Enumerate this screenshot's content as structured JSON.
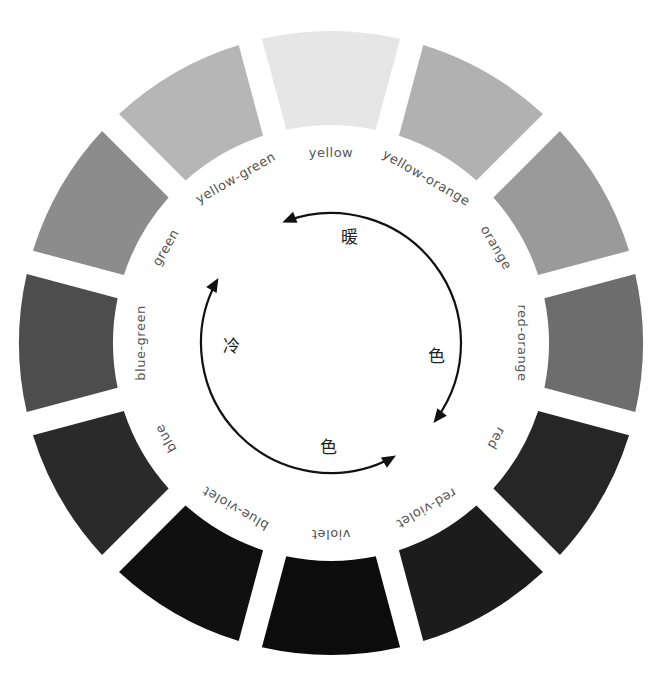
{
  "diagram": {
    "type": "color-wheel",
    "center": [
      331,
      343
    ],
    "outer_radius": 312,
    "inner_radius": 218,
    "label_radius": 190,
    "segments": [
      {
        "name": "yellow",
        "label": "yellow",
        "fill": "#e6e6e6"
      },
      {
        "name": "yellow-orange",
        "label": "yellow-orange",
        "fill": "#b1b1b1"
      },
      {
        "name": "orange",
        "label": "orange",
        "fill": "#9a9a9a"
      },
      {
        "name": "red-orange",
        "label": "red-orange",
        "fill": "#6d6d6d"
      },
      {
        "name": "red",
        "label": "red",
        "fill": "#262626"
      },
      {
        "name": "red-violet",
        "label": "red-violet",
        "fill": "#1c1c1c"
      },
      {
        "name": "violet",
        "label": "violet",
        "fill": "#0c0c0c"
      },
      {
        "name": "blue-violet",
        "label": "blue-violet",
        "fill": "#101010"
      },
      {
        "name": "blue",
        "label": "blue",
        "fill": "#2a2a2a"
      },
      {
        "name": "blue-green",
        "label": "blue-green",
        "fill": "#4d4d4d"
      },
      {
        "name": "green",
        "label": "green",
        "fill": "#8c8c8c"
      },
      {
        "name": "yellow-green",
        "label": "yellow-green",
        "fill": "#b6b6b6"
      }
    ],
    "warm": {
      "chars": [
        "暖",
        "色"
      ],
      "label": "暖色"
    },
    "cool": {
      "chars": [
        "冷",
        "色"
      ],
      "label": "冷色"
    },
    "arrow_radius": 130,
    "arrow_color": "#111111"
  }
}
